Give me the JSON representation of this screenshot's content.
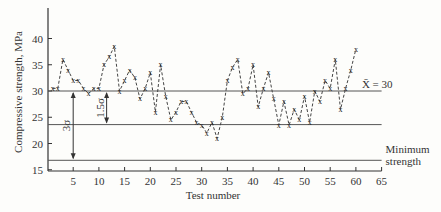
{
  "chart_data": {
    "type": "line",
    "title": "",
    "xlabel": "Test number",
    "ylabel": "Compressive strength, MPa",
    "xlim": [
      0,
      65
    ],
    "ylim": [
      14.5,
      45
    ],
    "x_ticks": [
      5,
      10,
      15,
      20,
      25,
      30,
      35,
      40,
      45,
      50,
      55,
      60,
      65
    ],
    "y_ticks": [
      15,
      20,
      25,
      30,
      35,
      40
    ],
    "grid": false,
    "marker": "x",
    "line_style": "dashed",
    "series": [
      {
        "name": "Test results",
        "x": [
          1,
          2,
          3,
          4,
          5,
          6,
          7,
          8,
          9,
          10,
          11,
          12,
          13,
          14,
          15,
          16,
          17,
          18,
          19,
          20,
          21,
          22,
          23,
          24,
          25,
          26,
          27,
          28,
          29,
          30,
          31,
          32,
          33,
          34,
          35,
          36,
          37,
          38,
          39,
          40,
          41,
          42,
          43,
          44,
          45,
          46,
          47,
          48,
          49,
          50,
          51,
          52,
          53,
          54,
          55,
          56,
          57,
          58,
          59,
          60
        ],
        "values": [
          30.5,
          30.5,
          36,
          34,
          32,
          32,
          30.5,
          29.5,
          30.5,
          30.5,
          35,
          36.5,
          38.5,
          30,
          32,
          34,
          32.5,
          28.5,
          30.5,
          33.5,
          26,
          35,
          29,
          24.5,
          26,
          28,
          28,
          26,
          24,
          23.5,
          22,
          24,
          21,
          25,
          32,
          34.5,
          36,
          29.5,
          30.5,
          35,
          27,
          30.5,
          33.5,
          28.5,
          23.5,
          28,
          23.5,
          26.5,
          24.5,
          29,
          24,
          30,
          28,
          32,
          30.5,
          36,
          26.5,
          30.5,
          34,
          38
        ]
      }
    ],
    "reference_lines": [
      {
        "name": "mean",
        "y": 30,
        "label": "X̄ = 30"
      },
      {
        "name": "mean-minus-1.5-sigma",
        "y": 23.6,
        "label": ""
      },
      {
        "name": "minimum-strength",
        "y": 16.8,
        "label_line1": "Minimum",
        "label_line2": "strength"
      }
    ],
    "annotations": [
      {
        "text": "3σ",
        "x": 5,
        "from": 30,
        "to": 16.8
      },
      {
        "text": "1.5σ",
        "x": 11.5,
        "from": 30,
        "to": 23.6
      }
    ]
  }
}
